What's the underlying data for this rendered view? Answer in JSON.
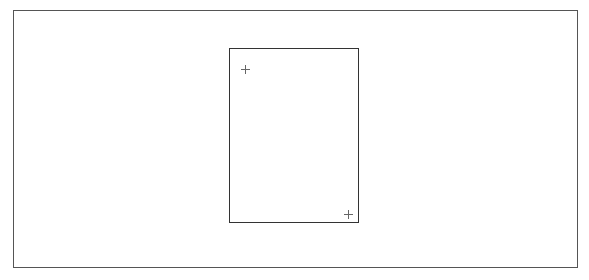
{
  "canvas": {
    "frame_color": "#555555",
    "background": "#ffffff"
  },
  "page_rect": {
    "border_color": "#333333",
    "handles": [
      {
        "icon": "crosshair-icon",
        "position": "top-left"
      },
      {
        "icon": "crosshair-icon",
        "position": "bottom-right"
      }
    ]
  }
}
